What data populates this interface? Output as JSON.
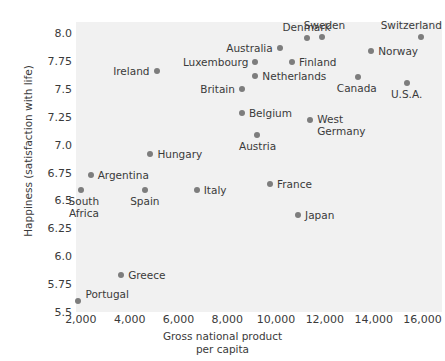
{
  "chart_data": {
    "type": "scatter",
    "title": "",
    "xlabel": "Gross national product\nper capita",
    "xlabel_line1": "Gross national product",
    "xlabel_line2": "per capita",
    "ylabel": "Happiness (satisfaction with life)",
    "xlim": [
      1800,
      16800
    ],
    "ylim": [
      5.5,
      8.1
    ],
    "grid": false,
    "legend": "none",
    "xticks": [
      "2,000",
      "4,000",
      "6,000",
      "8,000",
      "10,000",
      "12,000",
      "14,000",
      "16,000"
    ],
    "xtick_values": [
      2000,
      4000,
      6000,
      8000,
      10000,
      12000,
      14000,
      16000
    ],
    "yticks": [
      "5.5",
      "5.75",
      "6.0",
      "6.25",
      "6.5",
      "6.75",
      "7.0",
      "7.25",
      "7.5",
      "7.75",
      "8.0"
    ],
    "ytick_values": [
      5.5,
      5.75,
      6.0,
      6.25,
      6.5,
      6.75,
      7.0,
      7.25,
      7.5,
      7.75,
      8.0
    ],
    "point_color": "#7d7d7d",
    "panel_color": "#f1f1f1",
    "points": [
      {
        "label": "Portugal",
        "x": 1900,
        "y": 5.6,
        "label_pos": "right",
        "label_dx": 7,
        "label_dy": -12
      },
      {
        "label": "Greece",
        "x": 3650,
        "y": 5.83,
        "label_pos": "right",
        "label_dx": 7,
        "label_dy": -5
      },
      {
        "label": "South\nAfrica",
        "x": 2000,
        "y": 6.59,
        "label_pos": "center",
        "label_dx": 3,
        "label_dy": 6
      },
      {
        "label": "Argentina",
        "x": 2400,
        "y": 6.73,
        "label_pos": "right",
        "label_dx": 7,
        "label_dy": -5
      },
      {
        "label": "Spain",
        "x": 4620,
        "y": 6.59,
        "label_pos": "center",
        "label_dx": 0,
        "label_dy": 6
      },
      {
        "label": "Hungary",
        "x": 4850,
        "y": 6.92,
        "label_pos": "right",
        "label_dx": 7,
        "label_dy": -5
      },
      {
        "label": "Italy",
        "x": 6750,
        "y": 6.59,
        "label_pos": "right",
        "label_dx": 7,
        "label_dy": -5
      },
      {
        "label": "France",
        "x": 9750,
        "y": 6.65,
        "label_pos": "right",
        "label_dx": 7,
        "label_dy": -5
      },
      {
        "label": "Japan",
        "x": 10900,
        "y": 6.37,
        "label_pos": "right",
        "label_dx": 7,
        "label_dy": -5
      },
      {
        "label": "Austria",
        "x": 9200,
        "y": 7.09,
        "label_pos": "center",
        "label_dx": 1,
        "label_dy": 6
      },
      {
        "label": "West\nGermany",
        "x": 11400,
        "y": 7.22,
        "label_pos": "right",
        "label_dx": 7,
        "label_dy": -6
      },
      {
        "label": "Belgium",
        "x": 8600,
        "y": 7.28,
        "label_pos": "right",
        "label_dx": 7,
        "label_dy": -5
      },
      {
        "label": "Britain",
        "x": 8600,
        "y": 7.5,
        "label_pos": "left",
        "label_dx": -7,
        "label_dy": -5
      },
      {
        "label": "U.S.A.",
        "x": 15350,
        "y": 7.55,
        "label_pos": "center",
        "label_dx": 0,
        "label_dy": 6
      },
      {
        "label": "Canada",
        "x": 13350,
        "y": 7.61,
        "label_pos": "center",
        "label_dx": -1,
        "label_dy": 6
      },
      {
        "label": "Netherlands",
        "x": 9150,
        "y": 7.62,
        "label_pos": "right",
        "label_dx": 7,
        "label_dy": -5
      },
      {
        "label": "Ireland",
        "x": 5100,
        "y": 7.66,
        "label_pos": "left",
        "label_dx": -7,
        "label_dy": -5
      },
      {
        "label": "Luxembourg",
        "x": 9150,
        "y": 7.74,
        "label_pos": "left",
        "label_dx": -7,
        "label_dy": -5
      },
      {
        "label": "Finland",
        "x": 10650,
        "y": 7.74,
        "label_pos": "right",
        "label_dx": 7,
        "label_dy": -5
      },
      {
        "label": "Norway",
        "x": 13900,
        "y": 7.84,
        "label_pos": "right",
        "label_dx": 7,
        "label_dy": -5
      },
      {
        "label": "Australia",
        "x": 10150,
        "y": 7.87,
        "label_pos": "left",
        "label_dx": -7,
        "label_dy": -5
      },
      {
        "label": "Denmark",
        "x": 11250,
        "y": 7.96,
        "label_pos": "center",
        "label_dx": 0,
        "label_dy": -16
      },
      {
        "label": "Sweden",
        "x": 11900,
        "y": 7.97,
        "label_pos": "center",
        "label_dx": 2,
        "label_dy": -17
      },
      {
        "label": "Switzerland",
        "x": 15950,
        "y": 7.97,
        "label_pos": "center",
        "label_dx": -10,
        "label_dy": -17
      }
    ]
  }
}
